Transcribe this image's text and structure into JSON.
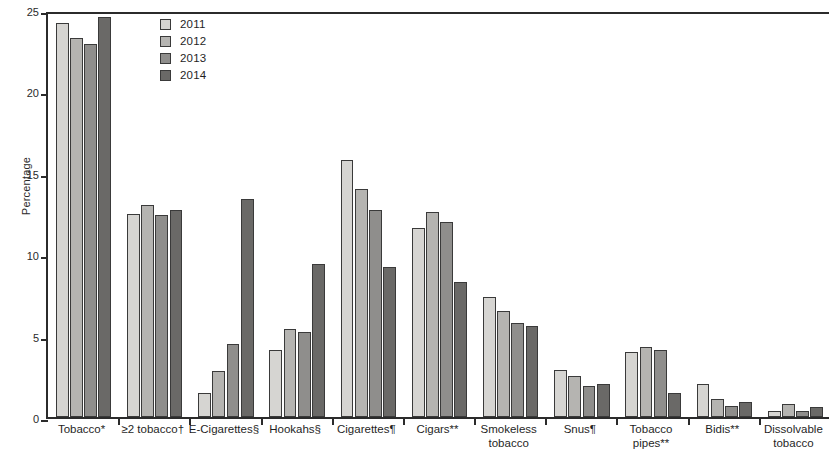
{
  "chart_data": {
    "type": "bar",
    "title": "",
    "xlabel": "",
    "ylabel": "Percentage",
    "ylim": [
      0,
      25
    ],
    "yticks": [
      0,
      5,
      10,
      15,
      20,
      25
    ],
    "grid": false,
    "legend_position": "top-left-inside",
    "categories": [
      "Tobacco*",
      "≥2 tobacco†",
      "E-Cigarettes§",
      "Hookahs§",
      "Cigarettes¶",
      "Cigars**",
      "Smokeless tobacco",
      "Snus¶",
      "Tobacco pipes**",
      "Bidis**",
      "Dissolvable tobacco"
    ],
    "series": [
      {
        "name": "2011",
        "color": "#d6d5d2",
        "values": [
          24.2,
          12.5,
          1.5,
          4.1,
          15.8,
          11.6,
          7.4,
          2.9,
          4.0,
          2.0,
          0.4
        ]
      },
      {
        "name": "2012",
        "color": "#b5b4b1",
        "values": [
          23.3,
          13.0,
          2.8,
          5.4,
          14.0,
          12.6,
          6.5,
          2.5,
          4.3,
          1.1,
          0.8
        ]
      },
      {
        "name": "2013",
        "color": "#8f8e8c",
        "values": [
          22.9,
          12.4,
          4.5,
          5.2,
          12.7,
          12.0,
          5.8,
          1.9,
          4.1,
          0.7,
          0.4
        ]
      },
      {
        "name": "2014",
        "color": "#6a6967",
        "values": [
          24.6,
          12.7,
          13.4,
          9.4,
          9.2,
          8.3,
          5.6,
          2.0,
          1.5,
          0.9,
          0.6
        ]
      }
    ]
  },
  "axis": {
    "y_title": "Percentage"
  },
  "legend": {
    "entries": [
      {
        "label": "2011"
      },
      {
        "label": "2012"
      },
      {
        "label": "2013"
      },
      {
        "label": "2014"
      }
    ]
  },
  "xlabels": [
    {
      "line1": "Tobacco*",
      "line2": ""
    },
    {
      "line1": "≥2 tobacco†",
      "line2": ""
    },
    {
      "line1": "E-Cigarettes§",
      "line2": ""
    },
    {
      "line1": "Hookahs§",
      "line2": ""
    },
    {
      "line1": "Cigarettes¶",
      "line2": ""
    },
    {
      "line1": "Cigars**",
      "line2": ""
    },
    {
      "line1": "Smokeless",
      "line2": "tobacco"
    },
    {
      "line1": "Snus¶",
      "line2": ""
    },
    {
      "line1": "Tobacco",
      "line2": "pipes**"
    },
    {
      "line1": "Bidis**",
      "line2": ""
    },
    {
      "line1": "Dissolvable",
      "line2": "tobacco"
    }
  ]
}
